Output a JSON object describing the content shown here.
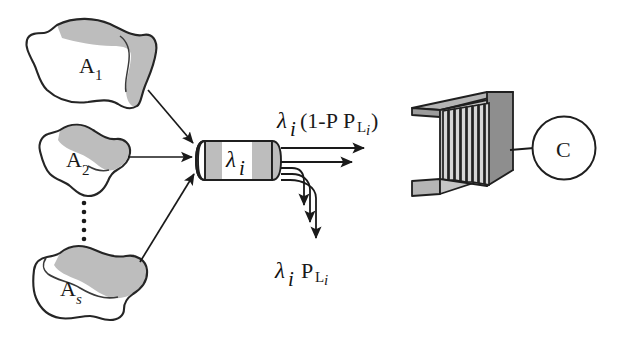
{
  "figure": {
    "kind": "queueing-network-diagram",
    "background_color": "#ffffff",
    "ink_color": "#1a1a1a",
    "shade_color": "#b8b8b8",
    "dark_shade_color": "#8a8a8a"
  },
  "sources": {
    "label_a1": "A",
    "sub_a1": "1",
    "label_a2": "A",
    "sub_a2": "2",
    "label_as": "A",
    "sub_as": "s",
    "ellipsis": "⋮"
  },
  "link": {
    "lambda": "λ",
    "lambda_sub": "i"
  },
  "flows": {
    "thru_lambda": "λ",
    "thru_sub": "i",
    "thru_expr": "(1-P",
    "thru_expr_sub_l": "L",
    "thru_expr_sub_i": "i",
    "thru_expr_close": ")",
    "loss_lambda": "λ",
    "loss_sub": "i",
    "loss_p": "P",
    "loss_p_sub_l": "L",
    "loss_p_sub_i": "i"
  },
  "server": {
    "queue_slots": 8,
    "circle_label": "C"
  }
}
